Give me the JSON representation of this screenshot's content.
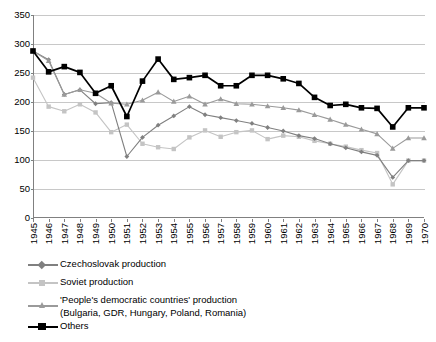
{
  "chart_data": {
    "type": "line",
    "title": "",
    "subtitle": "",
    "xlabel": "",
    "ylabel": "",
    "xlim": [
      1945,
      1970
    ],
    "ylim": [
      0,
      350
    ],
    "ytick_step": 50,
    "grid": true,
    "legend_position": "below",
    "categories": [
      "1945",
      "1946",
      "1947",
      "1948",
      "1949",
      "1950",
      "1951",
      "1952",
      "1953",
      "1954",
      "1955",
      "1956",
      "1957",
      "1958",
      "1959",
      "1960",
      "1961",
      "1962",
      "1963",
      "1964",
      "1965",
      "1966",
      "1967",
      "1968",
      "1969",
      "1970"
    ],
    "yticks": [
      0,
      50,
      100,
      150,
      200,
      250,
      300,
      350
    ],
    "series": [
      {
        "name": "Czechoslovak production",
        "color": "#808080",
        "marker": "diamond",
        "values": [
          288,
          273,
          213,
          221,
          197,
          199,
          106,
          139,
          160,
          176,
          192,
          178,
          173,
          168,
          163,
          156,
          150,
          142,
          137,
          128,
          121,
          114,
          108,
          70,
          99,
          99
        ]
      },
      {
        "name": "Soviet production",
        "color": "#c4c4c4",
        "marker": "square",
        "values": [
          242,
          192,
          184,
          196,
          182,
          148,
          161,
          128,
          122,
          119,
          139,
          151,
          140,
          148,
          151,
          136,
          142,
          140,
          133,
          128,
          123,
          117,
          112,
          58,
          99,
          99
        ]
      },
      {
        "name": "'People's democratic countries' production (Bulgaria, GDR, Hungary, Poland, Romania)",
        "color": "#9a9a9a",
        "marker": "triangle",
        "values": [
          288,
          271,
          213,
          221,
          215,
          198,
          196,
          203,
          217,
          201,
          210,
          196,
          205,
          197,
          196,
          193,
          190,
          186,
          178,
          170,
          161,
          153,
          145,
          120,
          138,
          138
        ]
      },
      {
        "name": "Others",
        "color": "#000000",
        "marker": "square",
        "values": [
          288,
          252,
          261,
          251,
          215,
          228,
          175,
          236,
          274,
          239,
          242,
          246,
          228,
          228,
          246,
          246,
          240,
          232,
          208,
          194,
          196,
          190,
          189,
          157,
          190,
          190
        ]
      }
    ]
  },
  "legend": {
    "items": [
      {
        "label": "Czechoslovak production",
        "label2": ""
      },
      {
        "label": "Soviet production",
        "label2": ""
      },
      {
        "label": "'People's democratic countries' production",
        "label2": "(Bulgaria, GDR, Hungary, Poland, Romania)"
      },
      {
        "label": "Others",
        "label2": ""
      }
    ]
  }
}
